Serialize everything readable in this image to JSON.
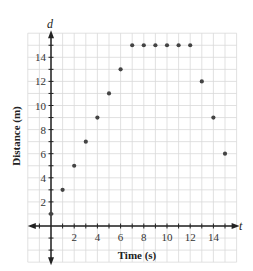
{
  "chart_data": {
    "type": "scatter",
    "title": "",
    "xlabel": "Time (s)",
    "ylabel": "Distance (m)",
    "x_axis_var": "t",
    "y_axis_var": "d",
    "xlim": [
      -2,
      16
    ],
    "ylim": [
      -3,
      16
    ],
    "x_ticks": [
      2,
      4,
      6,
      8,
      10,
      12,
      14
    ],
    "y_ticks": [
      2,
      4,
      6,
      8,
      10,
      12,
      14
    ],
    "grid": true,
    "legend": null,
    "points": [
      {
        "x": 0,
        "y": 1
      },
      {
        "x": 1,
        "y": 3
      },
      {
        "x": 2,
        "y": 5
      },
      {
        "x": 3,
        "y": 7
      },
      {
        "x": 4,
        "y": 9
      },
      {
        "x": 5,
        "y": 11
      },
      {
        "x": 6,
        "y": 13
      },
      {
        "x": 7,
        "y": 15
      },
      {
        "x": 8,
        "y": 15
      },
      {
        "x": 9,
        "y": 15
      },
      {
        "x": 10,
        "y": 15
      },
      {
        "x": 11,
        "y": 15
      },
      {
        "x": 12,
        "y": 15
      },
      {
        "x": 13,
        "y": 12
      },
      {
        "x": 14,
        "y": 9
      },
      {
        "x": 15,
        "y": 6
      }
    ],
    "colors": {
      "point": "#444444",
      "grid": "#d9d9d9",
      "axis": "#222222"
    }
  }
}
